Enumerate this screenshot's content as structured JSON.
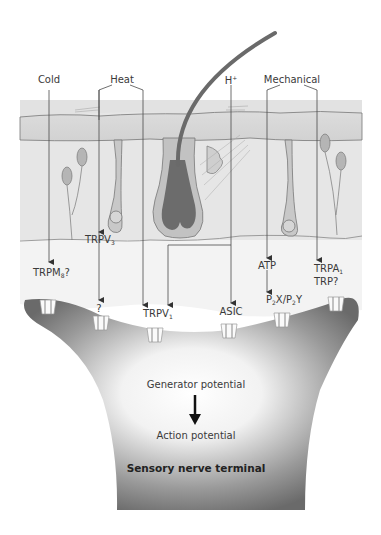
{
  "diagram": {
    "stimuli": {
      "cold": "Cold",
      "heat": "Heat",
      "proton": "H",
      "proton_sup": "+",
      "mechanical": "Mechanical"
    },
    "receptors": {
      "trpv3_base": "TRPV",
      "trpv3_sub": "3",
      "trpm8_base": "TRPM",
      "trpm8_sub": "8",
      "trpm8_suffix": "?",
      "unknown": "?",
      "trpv1_base": "TRPV",
      "trpv1_sub": "1",
      "asic": "ASIC",
      "atp": "ATP",
      "p2_a": "P",
      "p2_a_sub": "2",
      "p2_b": "X/P",
      "p2_b_sub": "2",
      "p2_c": "Y",
      "trpa1_base": "TRPA",
      "trpa1_sub": "1",
      "trp": "TRP?"
    },
    "terminal": {
      "generator": "Generator potential",
      "action": "Action potential",
      "title": "Sensory nerve terminal"
    },
    "colors": {
      "skin_light": "#ececec",
      "epidermis": "#d4d4d4",
      "hair": "#6e6e6e",
      "follicle": "#bdbdbd",
      "terminal_dark": "#6a6a6a",
      "line": "#4a4a4a"
    }
  }
}
